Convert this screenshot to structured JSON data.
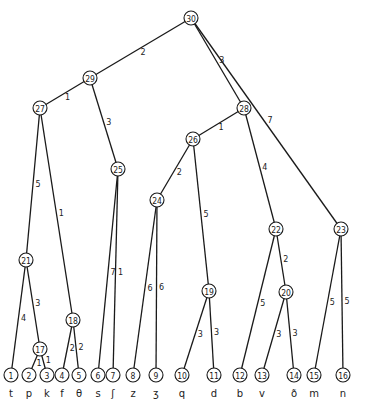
{
  "diagram": {
    "type": "tree",
    "nodes": [
      {
        "id": 1,
        "x": 11,
        "y": 375,
        "label": "t"
      },
      {
        "id": 2,
        "x": 29,
        "y": 375,
        "label": "p"
      },
      {
        "id": 3,
        "x": 47,
        "y": 375,
        "label": "k"
      },
      {
        "id": 4,
        "x": 62,
        "y": 375,
        "label": "f"
      },
      {
        "id": 5,
        "x": 79,
        "y": 375,
        "label": "θ"
      },
      {
        "id": 6,
        "x": 98,
        "y": 375,
        "label": "s"
      },
      {
        "id": 7,
        "x": 113,
        "y": 375,
        "label": "ʃ"
      },
      {
        "id": 8,
        "x": 133,
        "y": 375,
        "label": "z"
      },
      {
        "id": 9,
        "x": 156,
        "y": 375,
        "label": "ʒ"
      },
      {
        "id": 10,
        "x": 182,
        "y": 375,
        "label": "q"
      },
      {
        "id": 11,
        "x": 214,
        "y": 375,
        "label": "d"
      },
      {
        "id": 12,
        "x": 240,
        "y": 375,
        "label": "b"
      },
      {
        "id": 13,
        "x": 262,
        "y": 375,
        "label": "v"
      },
      {
        "id": 14,
        "x": 294,
        "y": 375,
        "label": "ð"
      },
      {
        "id": 15,
        "x": 314,
        "y": 375,
        "label": "m"
      },
      {
        "id": 16,
        "x": 343,
        "y": 375,
        "label": "n"
      },
      {
        "id": 17,
        "x": 40,
        "y": 349,
        "label": ""
      },
      {
        "id": 18,
        "x": 73,
        "y": 320,
        "label": ""
      },
      {
        "id": 19,
        "x": 209,
        "y": 291,
        "label": ""
      },
      {
        "id": 20,
        "x": 286,
        "y": 292,
        "label": ""
      },
      {
        "id": 21,
        "x": 26,
        "y": 260,
        "label": ""
      },
      {
        "id": 22,
        "x": 276,
        "y": 229,
        "label": ""
      },
      {
        "id": 23,
        "x": 341,
        "y": 229,
        "label": ""
      },
      {
        "id": 24,
        "x": 157,
        "y": 200,
        "label": ""
      },
      {
        "id": 25,
        "x": 118,
        "y": 169,
        "label": ""
      },
      {
        "id": 26,
        "x": 193,
        "y": 139,
        "label": ""
      },
      {
        "id": 27,
        "x": 40,
        "y": 108,
        "label": ""
      },
      {
        "id": 28,
        "x": 244,
        "y": 108,
        "label": ""
      },
      {
        "id": 29,
        "x": 90,
        "y": 78,
        "label": ""
      },
      {
        "id": 30,
        "x": 191,
        "y": 18,
        "label": ""
      }
    ],
    "edges": [
      {
        "from": 30,
        "to": 29,
        "weight": "2"
      },
      {
        "from": 30,
        "to": 28,
        "weight": "3"
      },
      {
        "from": 30,
        "to": 23,
        "weight": "7"
      },
      {
        "from": 29,
        "to": 27,
        "weight": "1"
      },
      {
        "from": 29,
        "to": 25,
        "weight": "3"
      },
      {
        "from": 27,
        "to": 21,
        "weight": "5"
      },
      {
        "from": 27,
        "to": 18,
        "weight": "1"
      },
      {
        "from": 28,
        "to": 26,
        "weight": "1"
      },
      {
        "from": 28,
        "to": 22,
        "weight": "4"
      },
      {
        "from": 26,
        "to": 24,
        "weight": "2"
      },
      {
        "from": 26,
        "to": 19,
        "weight": "5"
      },
      {
        "from": 25,
        "to": 6,
        "weight": "7"
      },
      {
        "from": 25,
        "to": 7,
        "weight": "1"
      },
      {
        "from": 24,
        "to": 8,
        "weight": "6"
      },
      {
        "from": 24,
        "to": 9,
        "weight": "6"
      },
      {
        "from": 21,
        "to": 1,
        "weight": "4"
      },
      {
        "from": 21,
        "to": 17,
        "weight": "3"
      },
      {
        "from": 17,
        "to": 2,
        "weight": "1"
      },
      {
        "from": 17,
        "to": 3,
        "weight": "1"
      },
      {
        "from": 18,
        "to": 4,
        "weight": "2"
      },
      {
        "from": 18,
        "to": 5,
        "weight": "2"
      },
      {
        "from": 19,
        "to": 10,
        "weight": "3"
      },
      {
        "from": 19,
        "to": 11,
        "weight": "3"
      },
      {
        "from": 22,
        "to": 12,
        "weight": "5"
      },
      {
        "from": 22,
        "to": 20,
        "weight": "2"
      },
      {
        "from": 20,
        "to": 13,
        "weight": "3"
      },
      {
        "from": 20,
        "to": 14,
        "weight": "3"
      },
      {
        "from": 23,
        "to": 15,
        "weight": "5"
      },
      {
        "from": 23,
        "to": 16,
        "weight": "5"
      }
    ],
    "leaf_labels": [
      "t",
      "p",
      "k",
      "f",
      "θ",
      "s",
      "ʃ",
      "z",
      "ʒ",
      "q",
      "d",
      "b",
      "v",
      "ð",
      "m",
      "n"
    ]
  }
}
